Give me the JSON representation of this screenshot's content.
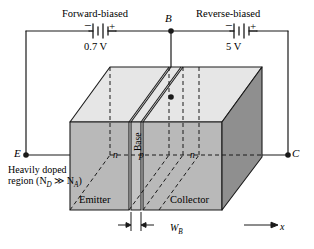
{
  "figure": {
    "type": "device-cross-section-3d"
  },
  "circuit": {
    "left_source": {
      "caption": "Forward-biased",
      "voltage": "0.7 V",
      "minus_sign": "−",
      "plus_sign": "+",
      "symbol": "battery-icon"
    },
    "right_source": {
      "caption": "Reverse-biased",
      "voltage": "5 V",
      "minus_sign": "−",
      "plus_sign": "+",
      "symbol": "battery-icon"
    },
    "terminals": {
      "base": "B",
      "emitter": "E",
      "collector": "C"
    }
  },
  "device": {
    "regions": [
      {
        "doping": "n",
        "name": "Emitter"
      },
      {
        "doping": "p",
        "name": "Base"
      },
      {
        "doping": "n",
        "name": "Collector"
      }
    ],
    "doping_note_line1": "Heavily doped",
    "doping_note_line2_prefix": "region (N",
    "doping_note_sub1": "D",
    "doping_note_mid": " ≫ N",
    "doping_note_sub2": "A",
    "doping_note_suffix": ")",
    "base_width_label": "W",
    "base_width_sub": "B",
    "axis_label": "x"
  },
  "colors": {
    "top_face": "#e6e6e6",
    "front_face": "#b9b9b9",
    "right_face": "#909090",
    "base_front_face": "#c2c2c2",
    "line": "#1a1a1a",
    "background": "#ffffff"
  }
}
